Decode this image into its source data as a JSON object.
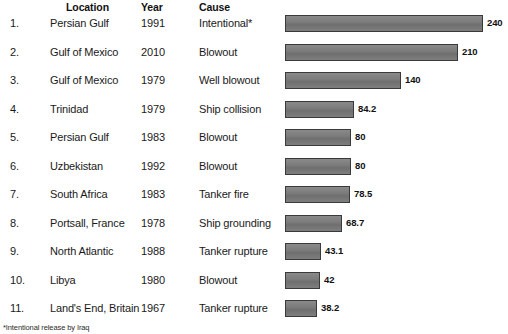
{
  "header": {
    "location_label": "Location",
    "year_label": "Year",
    "cause_label": "Cause"
  },
  "footnote": "*Intentional release by Iraq",
  "style": {
    "bar_fill": "#7b7b7b",
    "bar_border": "#3a3a3a",
    "text_color": "#1a1a1a",
    "background": "#ffffff"
  },
  "chart_data": {
    "type": "bar",
    "title": "",
    "subtitle": "",
    "xlabel": "",
    "ylabel": "",
    "orientation": "horizontal",
    "grid": false,
    "legend": "none",
    "xlim": [
      0,
      240
    ],
    "value_unit": "million gallons",
    "columns": [
      "#",
      "Location",
      "Year",
      "Cause",
      "Spill size"
    ],
    "categories": [
      "Persian Gulf",
      "Gulf of Mexico",
      "Gulf of Mexico",
      "Trinidad",
      "Persian Gulf",
      "Uzbekistan",
      "South Africa",
      "Portsall, France",
      "North Atlantic",
      "Libya",
      "Land's End, Britain"
    ],
    "values": [
      240,
      210,
      140,
      84.2,
      80,
      80,
      78.5,
      68.7,
      43.1,
      42,
      38.2
    ],
    "value_labels": [
      "240",
      "210",
      "140",
      "84.2",
      "80",
      "80",
      "78.5",
      "68.7",
      "43.1",
      "42",
      "38.2"
    ],
    "rows": [
      {
        "rank": "1.",
        "location": "Persian Gulf",
        "year": "1991",
        "cause": "Intentional*",
        "value": 240,
        "value_label": "240"
      },
      {
        "rank": "2.",
        "location": "Gulf of Mexico",
        "year": "2010",
        "cause": "Blowout",
        "value": 210,
        "value_label": "210"
      },
      {
        "rank": "3.",
        "location": "Gulf of Mexico",
        "year": "1979",
        "cause": "Well blowout",
        "value": 140,
        "value_label": "140"
      },
      {
        "rank": "4.",
        "location": "Trinidad",
        "year": "1979",
        "cause": "Ship collision",
        "value": 84.2,
        "value_label": "84.2"
      },
      {
        "rank": "5.",
        "location": "Persian Gulf",
        "year": "1983",
        "cause": "Blowout",
        "value": 80,
        "value_label": "80"
      },
      {
        "rank": "6.",
        "location": "Uzbekistan",
        "year": "1992",
        "cause": "Blowout",
        "value": 80,
        "value_label": "80"
      },
      {
        "rank": "7.",
        "location": "South Africa",
        "year": "1983",
        "cause": "Tanker fire",
        "value": 78.5,
        "value_label": "78.5"
      },
      {
        "rank": "8.",
        "location": "Portsall, France",
        "year": "1978",
        "cause": "Ship grounding",
        "value": 68.7,
        "value_label": "68.7"
      },
      {
        "rank": "9.",
        "location": "North Atlantic",
        "year": "1988",
        "cause": "Tanker rupture",
        "value": 43.1,
        "value_label": "43.1"
      },
      {
        "rank": "10.",
        "location": "Libya",
        "year": "1980",
        "cause": "Blowout",
        "value": 42,
        "value_label": "42"
      },
      {
        "rank": "11.",
        "location": "Land's End, Britain",
        "year": "1967",
        "cause": "Tanker rupture",
        "value": 38.2,
        "value_label": "38.2"
      }
    ]
  }
}
